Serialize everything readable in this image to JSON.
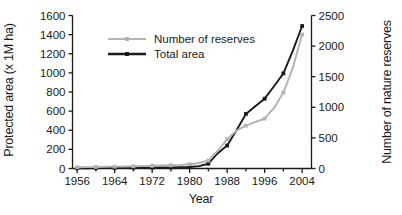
{
  "chart_data": {
    "type": "line",
    "title": "",
    "xlabel": "Year",
    "ylabel": "Protected area (x 1M ha)",
    "ylabel_right": "Number of nature reserves",
    "grid": false,
    "legend_position": "top-left",
    "xlim": [
      1955,
      2006
    ],
    "xticks": [
      1956,
      1964,
      1972,
      1980,
      1988,
      1996,
      2004
    ],
    "xticks_minor": [
      1960,
      1968,
      1976,
      1984,
      1992,
      2000
    ],
    "ylim_left": [
      0,
      1600
    ],
    "yticks_left": [
      0,
      200,
      400,
      600,
      800,
      1000,
      1200,
      1400,
      1600
    ],
    "ylim_right": [
      0,
      2500
    ],
    "yticks_right": [
      0,
      500,
      1000,
      1500,
      2000,
      2500
    ],
    "x": [
      1956,
      1958,
      1960,
      1962,
      1964,
      1966,
      1968,
      1970,
      1972,
      1974,
      1976,
      1978,
      1980,
      1982,
      1984,
      1986,
      1988,
      1990,
      1992,
      1994,
      1996,
      1998,
      2000,
      2002,
      2004
    ],
    "series": [
      {
        "name": "Total area",
        "axis": "left",
        "color": "#1a1a1a",
        "marker": "square",
        "values": [
          2,
          3,
          4,
          5,
          6,
          7,
          8,
          9,
          10,
          11,
          12,
          14,
          16,
          25,
          50,
          160,
          240,
          400,
          570,
          650,
          730,
          860,
          995,
          1230,
          1490
        ]
      },
      {
        "name": "Number of reserves",
        "axis": "right",
        "color": "#b3b3b3",
        "marker": "square",
        "values": [
          20,
          22,
          25,
          28,
          30,
          33,
          36,
          40,
          44,
          48,
          52,
          58,
          70,
          90,
          130,
          290,
          480,
          620,
          700,
          760,
          815,
          990,
          1240,
          1640,
          2190
        ]
      }
    ],
    "legend": [
      {
        "label": "Number of reserves",
        "color": "#b3b3b3"
      },
      {
        "label": "Total area",
        "color": "#1a1a1a"
      }
    ]
  }
}
